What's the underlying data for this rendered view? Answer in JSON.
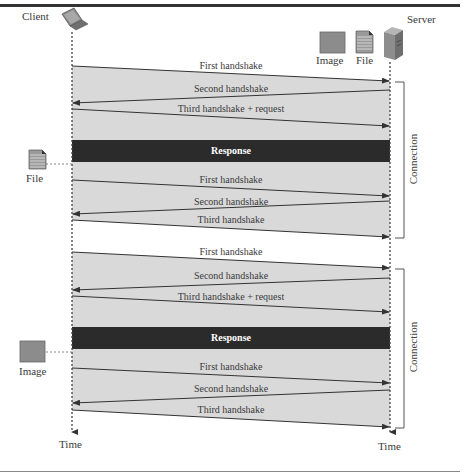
{
  "diagram": {
    "client": {
      "label": "Client",
      "icon": "laptop-icon"
    },
    "server": {
      "label": "Server",
      "icon": "server-tower-icon"
    },
    "server_resources": [
      {
        "label": "Image",
        "icon": "image-icon"
      },
      {
        "label": "File",
        "icon": "file-document-icon"
      }
    ],
    "time_labels": {
      "client": "Time",
      "server": "Time"
    },
    "connections": [
      {
        "label": "Connection",
        "messages": [
          {
            "label": "First handshake",
            "direction": "client-to-server"
          },
          {
            "label": "Second handshake",
            "direction": "server-to-client"
          },
          {
            "label": "Third handshake + request",
            "direction": "client-to-server"
          },
          {
            "label": "Response",
            "direction": "server-to-client",
            "type": "response-bar"
          },
          {
            "label": "First handshake",
            "direction": "client-to-server"
          },
          {
            "label": "Second handshake",
            "direction": "server-to-client"
          },
          {
            "label": "Third handshake",
            "direction": "client-to-server"
          }
        ],
        "received": {
          "label": "File",
          "icon": "file-document-icon"
        }
      },
      {
        "label": "Connection",
        "messages": [
          {
            "label": "First handshake",
            "direction": "client-to-server"
          },
          {
            "label": "Second handshake",
            "direction": "server-to-client"
          },
          {
            "label": "Third handshake + request",
            "direction": "client-to-server"
          },
          {
            "label": "Response",
            "direction": "server-to-client",
            "type": "response-bar"
          },
          {
            "label": "First handshake",
            "direction": "client-to-server"
          },
          {
            "label": "Second handshake",
            "direction": "server-to-client"
          },
          {
            "label": "Third handshake",
            "direction": "client-to-server"
          }
        ],
        "received": {
          "label": "Image",
          "icon": "image-icon"
        }
      }
    ],
    "colors": {
      "shade": "#d9d9d9",
      "response_bar": "#2b2b2b",
      "line": "#333333",
      "image_fill": "#8c8c8c"
    }
  }
}
